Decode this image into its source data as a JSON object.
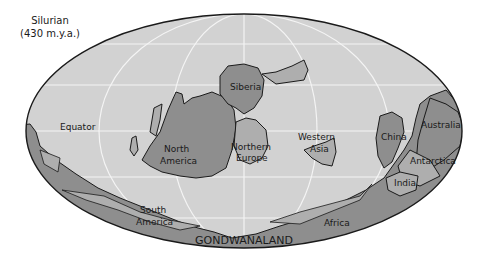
{
  "map": {
    "title": "Silurian",
    "subtitle": "(430 m.y.a.)",
    "projection": "Mollweide world map",
    "colors": {
      "ocean": "#d2d2d2",
      "shelf": "#aeaeae",
      "land": "#8e8e8e",
      "outline": "#1a1a1a",
      "grid": "#f4f4f4"
    },
    "labels": {
      "equator": "Equator",
      "siberia": "Siberia",
      "north_america_1": "North",
      "north_america_2": "America",
      "northern_europe_1": "Northern",
      "northern_europe_2": "Europe",
      "western_asia_1": "Western",
      "western_asia_2": "Asia",
      "china": "China",
      "australia": "Australia",
      "antarctica": "Antarctica",
      "india": "India",
      "south_america_1": "South",
      "south_america_2": "America",
      "africa": "Africa",
      "gondwanaland": "GONDWANALAND"
    }
  }
}
